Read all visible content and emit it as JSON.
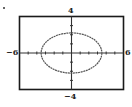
{
  "chart_data": {
    "type": "line",
    "title": "",
    "xlabel": "",
    "ylabel": "",
    "xlim": [
      -6,
      6
    ],
    "ylim": [
      -4,
      4
    ],
    "grid": false,
    "legend": null,
    "tick_labels": {
      "x_min": "-6",
      "x_max": "6",
      "y_max": "4",
      "y_min": "-4"
    },
    "x_ticks_every": 1,
    "y_ticks_every": 1,
    "series": [
      {
        "name": "ellipse",
        "shape": "ellipse",
        "center": [
          0,
          0
        ],
        "semi_axis_x": 3.5,
        "semi_axis_y": 2.2,
        "x_intercepts": [
          -3.5,
          3.5
        ],
        "y_intercepts": [
          -2.2,
          2.2
        ]
      }
    ]
  },
  "labels": {
    "x_min": "−6",
    "x_max": "6",
    "y_max": "4",
    "y_min": "−4"
  },
  "colors": {
    "frame": "#1a1a1a",
    "axis": "#333333",
    "curve": "#555555"
  }
}
